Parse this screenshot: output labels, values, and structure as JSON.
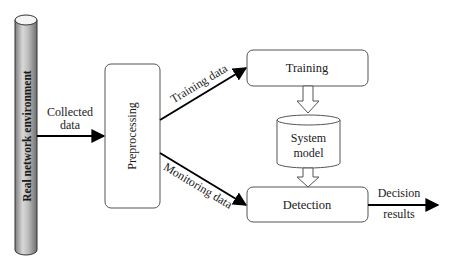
{
  "diagram": {
    "colors": {
      "stroke": "#333333",
      "arrow": "#000000",
      "cylinder_light": "#e6e6e6",
      "cylinder_dark": "#8a8a8a",
      "background": "#ffffff"
    },
    "nodes": {
      "environment": {
        "label": "Real network environment",
        "shape": "vertical-cylinder"
      },
      "preprocessing": {
        "label": "Preprocessing",
        "shape": "rounded-rect"
      },
      "training": {
        "label": "Training",
        "shape": "rounded-rect"
      },
      "system_model": {
        "label_line1": "System",
        "label_line2": "model",
        "shape": "database-cylinder"
      },
      "detection": {
        "label": "Detection",
        "shape": "rounded-rect"
      }
    },
    "edges": {
      "collected": {
        "label_line1": "Collected",
        "label_line2": "data",
        "from": "environment",
        "to": "preprocessing"
      },
      "training_data": {
        "label": "Training data",
        "from": "preprocessing",
        "to": "training"
      },
      "monitoring_data": {
        "label": "Monitoring data",
        "from": "preprocessing",
        "to": "detection"
      },
      "train_to_model": {
        "style": "hollow-arrow",
        "from": "training",
        "to": "system_model"
      },
      "model_to_detect": {
        "style": "hollow-arrow",
        "from": "system_model",
        "to": "detection"
      },
      "decision": {
        "label_line1": "Decision",
        "label_line2": "results",
        "from": "detection",
        "to": "output"
      }
    }
  }
}
